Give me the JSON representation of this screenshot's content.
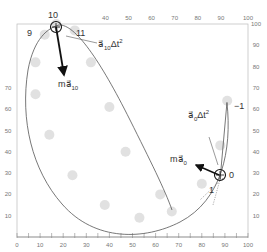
{
  "figure": {
    "type": "trajectory-force-diagram",
    "axes": {
      "x_range": [
        0,
        100
      ],
      "y_range": [
        0,
        100
      ],
      "bottom_ticks": [
        "0",
        "10",
        "20",
        "30",
        "40",
        "50",
        "60",
        "70",
        "80",
        "90",
        "100"
      ],
      "top_ticks": [
        "40",
        "50",
        "60",
        "70",
        "80",
        "90",
        "100"
      ],
      "left_ticks": [
        "10",
        "20",
        "30",
        "40",
        "50",
        "60",
        "70"
      ],
      "right_ticks": [
        "10",
        "20",
        "30",
        "40",
        "50",
        "60",
        "70",
        "80",
        "90",
        "100"
      ]
    },
    "point_labels": {
      "p10": "10",
      "p9": "9",
      "p11": "11",
      "p0": "0",
      "p1": "1",
      "pm1": "−1"
    },
    "vectors": {
      "force10": {
        "label": "m",
        "sym": "a⃗",
        "sub": "10"
      },
      "dv10": {
        "label": "a⃗",
        "sub": "10",
        "tail": "Δt",
        "sup": "2"
      },
      "force0": {
        "label": "m",
        "sym": "a⃗",
        "sub": "0"
      },
      "dv0": {
        "label": "a⃗",
        "sub": "0",
        "tail": "Δt",
        "sup": "2"
      }
    },
    "colors": {
      "frame": "#bbbbbb",
      "curve": "#555555",
      "ball": "#d9d9d9",
      "arrow": "#111111"
    }
  },
  "chart_data": {
    "type": "scatter",
    "title": "",
    "xlabel": "",
    "ylabel": "",
    "xlim": [
      0,
      100
    ],
    "ylim": [
      0,
      100
    ],
    "series": [
      {
        "name": "ball positions",
        "points": [
          {
            "label": "-1",
            "x": 91,
            "y": 64
          },
          {
            "label": "0",
            "x": 88,
            "y": 43
          },
          {
            "label": "1",
            "x": 80,
            "y": 25
          },
          {
            "label": "2",
            "x": 67,
            "y": 12
          },
          {
            "label": "3",
            "x": 53,
            "y": 9
          },
          {
            "label": "4",
            "x": 38,
            "y": 15
          },
          {
            "label": "5",
            "x": 24,
            "y": 29
          },
          {
            "label": "6",
            "x": 14,
            "y": 48
          },
          {
            "label": "7",
            "x": 8,
            "y": 67
          },
          {
            "label": "8",
            "x": 8,
            "y": 82
          },
          {
            "label": "9",
            "x": 12,
            "y": 95
          },
          {
            "label": "10",
            "x": 17,
            "y": 100
          },
          {
            "label": "11",
            "x": 25,
            "y": 97
          },
          {
            "label": "12",
            "x": 32,
            "y": 82
          },
          {
            "label": "13",
            "x": 40,
            "y": 61
          },
          {
            "label": "14",
            "x": 47,
            "y": 40
          },
          {
            "label": "15",
            "x": 62,
            "y": 20
          }
        ]
      }
    ],
    "annotations": [
      "10",
      "9",
      "11",
      "0",
      "1",
      "-1",
      "m a10",
      "a10 Δt^2",
      "m a0",
      "a0 Δt^2"
    ],
    "grid": false
  }
}
